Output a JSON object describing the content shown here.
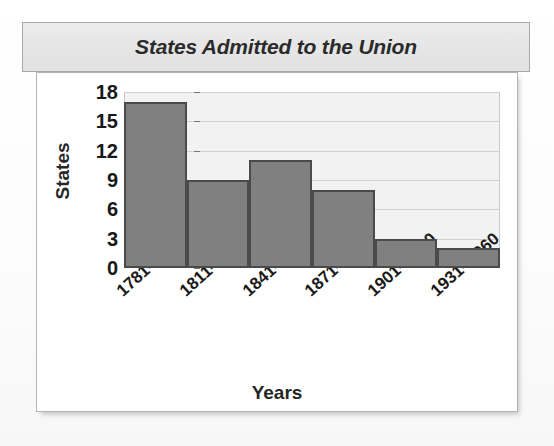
{
  "chart_data": {
    "type": "bar",
    "title": "States Admitted to the Union",
    "xlabel": "Years",
    "ylabel": "States",
    "categories": [
      "1781–1810",
      "1811–1840",
      "1841–1870",
      "1871–1900",
      "1901–1930",
      "1931–1960"
    ],
    "values": [
      17,
      9,
      11,
      8,
      3,
      2
    ],
    "ylim": [
      0,
      18
    ],
    "yticks": [
      0,
      3,
      6,
      9,
      12,
      15,
      18
    ],
    "grid": true,
    "legend": "none",
    "bar_color": "#808080",
    "bar_border_color": "#4a4a4a",
    "plot_background": "#f2f2f2",
    "title_banner_color": "#e6e6e6",
    "text_color": "#1a1a1a"
  }
}
